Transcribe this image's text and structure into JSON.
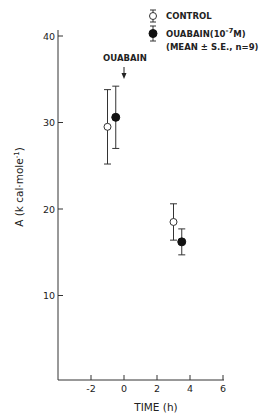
{
  "chart_data": {
    "type": "scatter",
    "title": "",
    "xlabel": "TIME (h)",
    "ylabel": "A  (k cal·mole⁻¹)",
    "xlim": [
      -4,
      6
    ],
    "ylim": [
      0,
      41
    ],
    "x_ticks": [
      -2,
      0,
      2,
      4,
      6
    ],
    "x_tick_labels": [
      "-2",
      "0",
      "2",
      "4",
      "6"
    ],
    "y_ticks": [
      10,
      20,
      30,
      40
    ],
    "y_tick_labels": [
      "10",
      "20",
      "30",
      "40"
    ],
    "grid": false,
    "legend_position": "top-right",
    "legend": [
      {
        "label": "CONTROL",
        "marker": "open-circle"
      },
      {
        "label": "OUABAIN(10⁻⁷M)",
        "marker": "filled-circle"
      }
    ],
    "legend_note": "(MEAN ± S.E., n=9)",
    "annotations": [
      {
        "text": "OUABAIN",
        "x": 0,
        "arrow": "down"
      }
    ],
    "series": [
      {
        "name": "CONTROL",
        "marker": "open-circle",
        "points": [
          {
            "x": -1.0,
            "y": 29.5,
            "err": 4.3
          },
          {
            "x": 3.0,
            "y": 18.5,
            "err": 2.1
          }
        ]
      },
      {
        "name": "OUABAIN(10⁻⁷M)",
        "marker": "filled-circle",
        "points": [
          {
            "x": -0.5,
            "y": 30.6,
            "err": 3.6
          },
          {
            "x": 3.5,
            "y": 16.2,
            "err": 1.5
          }
        ]
      }
    ]
  },
  "legend": {
    "control_label": "CONTROL",
    "ouabain_label_main": "OUABAIN(10",
    "ouabain_label_exp": "-7",
    "ouabain_label_unit": "M)",
    "note": "(MEAN ± S.E., n=9)"
  },
  "annotation": {
    "text": "OUABAIN"
  },
  "axes": {
    "xlabel": "TIME (h)",
    "ylabel_main": "A  (k cal·mole",
    "ylabel_exp": "-1",
    "ylabel_close": ")"
  }
}
